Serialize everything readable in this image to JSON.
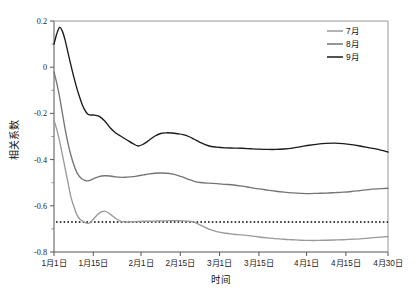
{
  "chart_data": {
    "type": "line",
    "title": "",
    "xlabel": "时间",
    "ylabel": "相关系数",
    "ylim": [
      -0.8,
      0.2
    ],
    "yticks": [
      "0.2",
      "0",
      "-0.2",
      "-0.4",
      "-0.6",
      "-0.8"
    ],
    "ytick_values": [
      0.2,
      0,
      -0.2,
      -0.4,
      -0.6,
      -0.8
    ],
    "grid": false,
    "legend_position": "top-right",
    "x_categories": [
      "1月1日",
      "1月15日",
      "2月1日",
      "2月15日",
      "3月1日",
      "3月15日",
      "4月1日",
      "4月15日",
      "4月30日"
    ],
    "x_tick_days": [
      0,
      14,
      31,
      45,
      59,
      73,
      90,
      104,
      119
    ],
    "x_range_days": [
      0,
      119
    ],
    "reference_line": {
      "label": "",
      "value": -0.67,
      "style": "dotted",
      "color": "#000000"
    },
    "series": [
      {
        "name": "7月",
        "color": "#9a9a9a",
        "x": [
          0,
          1,
          2,
          3,
          4,
          5,
          6,
          7,
          8,
          9,
          10,
          11,
          12,
          13,
          14,
          16,
          18,
          20,
          22,
          24,
          26,
          28,
          30,
          32,
          34,
          36,
          38,
          40,
          42,
          44,
          46,
          48,
          50,
          52,
          55,
          58,
          61,
          64,
          67,
          70,
          73,
          76,
          79,
          82,
          85,
          88,
          91,
          94,
          97,
          100,
          103,
          106,
          109,
          112,
          115,
          119
        ],
        "values": [
          -0.23,
          -0.27,
          -0.32,
          -0.38,
          -0.44,
          -0.5,
          -0.56,
          -0.6,
          -0.635,
          -0.655,
          -0.665,
          -0.672,
          -0.676,
          -0.672,
          -0.658,
          -0.633,
          -0.623,
          -0.636,
          -0.655,
          -0.667,
          -0.67,
          -0.669,
          -0.668,
          -0.667,
          -0.667,
          -0.666,
          -0.665,
          -0.665,
          -0.664,
          -0.664,
          -0.665,
          -0.667,
          -0.672,
          -0.683,
          -0.7,
          -0.712,
          -0.719,
          -0.723,
          -0.726,
          -0.73,
          -0.735,
          -0.739,
          -0.742,
          -0.745,
          -0.747,
          -0.749,
          -0.75,
          -0.75,
          -0.749,
          -0.748,
          -0.747,
          -0.745,
          -0.743,
          -0.74,
          -0.737,
          -0.733
        ]
      },
      {
        "name": "8月",
        "color": "#757575",
        "x": [
          0,
          1,
          2,
          3,
          4,
          5,
          6,
          7,
          8,
          9,
          10,
          11,
          12,
          13,
          14,
          16,
          18,
          20,
          22,
          24,
          26,
          28,
          30,
          32,
          34,
          36,
          38,
          40,
          42,
          44,
          46,
          48,
          50,
          52,
          55,
          58,
          61,
          64,
          67,
          70,
          73,
          76,
          79,
          82,
          85,
          88,
          91,
          94,
          97,
          100,
          103,
          106,
          109,
          112,
          115,
          119
        ],
        "values": [
          -0.02,
          -0.07,
          -0.13,
          -0.2,
          -0.27,
          -0.33,
          -0.38,
          -0.42,
          -0.452,
          -0.472,
          -0.484,
          -0.49,
          -0.492,
          -0.489,
          -0.483,
          -0.474,
          -0.47,
          -0.471,
          -0.475,
          -0.477,
          -0.476,
          -0.474,
          -0.47,
          -0.466,
          -0.462,
          -0.459,
          -0.458,
          -0.459,
          -0.462,
          -0.468,
          -0.476,
          -0.486,
          -0.494,
          -0.499,
          -0.502,
          -0.504,
          -0.507,
          -0.51,
          -0.515,
          -0.521,
          -0.527,
          -0.532,
          -0.537,
          -0.541,
          -0.544,
          -0.546,
          -0.547,
          -0.546,
          -0.545,
          -0.543,
          -0.541,
          -0.538,
          -0.534,
          -0.53,
          -0.527,
          -0.524
        ]
      },
      {
        "name": "9月",
        "color": "#1a1a1a",
        "x": [
          0,
          1,
          2,
          3,
          4,
          5,
          6,
          7,
          8,
          9,
          10,
          11,
          12,
          13,
          14,
          16,
          18,
          20,
          22,
          24,
          26,
          28,
          30,
          32,
          34,
          36,
          38,
          40,
          42,
          44,
          46,
          48,
          50,
          52,
          55,
          58,
          61,
          64,
          67,
          70,
          73,
          76,
          79,
          82,
          85,
          88,
          91,
          94,
          97,
          100,
          103,
          106,
          109,
          112,
          115,
          119
        ],
        "values": [
          0.1,
          0.145,
          0.172,
          0.155,
          0.115,
          0.062,
          0.01,
          -0.04,
          -0.085,
          -0.125,
          -0.16,
          -0.186,
          -0.203,
          -0.207,
          -0.207,
          -0.212,
          -0.232,
          -0.262,
          -0.285,
          -0.3,
          -0.315,
          -0.33,
          -0.341,
          -0.332,
          -0.315,
          -0.298,
          -0.287,
          -0.284,
          -0.285,
          -0.288,
          -0.292,
          -0.3,
          -0.312,
          -0.325,
          -0.34,
          -0.346,
          -0.349,
          -0.35,
          -0.351,
          -0.353,
          -0.355,
          -0.356,
          -0.356,
          -0.354,
          -0.35,
          -0.344,
          -0.338,
          -0.333,
          -0.33,
          -0.329,
          -0.331,
          -0.335,
          -0.341,
          -0.348,
          -0.355,
          -0.367
        ]
      }
    ]
  },
  "legend": {
    "items": [
      {
        "label": "7月",
        "color": "#9a9a9a"
      },
      {
        "label": "8月",
        "color": "#757575"
      },
      {
        "label": "9月",
        "color": "#1a1a1a"
      }
    ]
  }
}
